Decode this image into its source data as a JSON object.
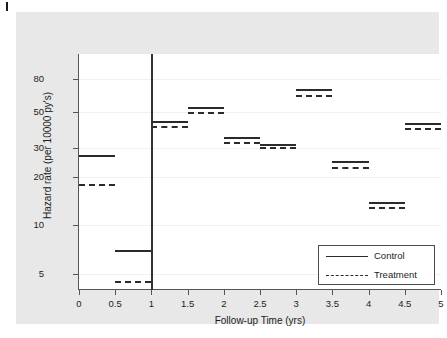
{
  "chart_data": {
    "type": "line",
    "title": "",
    "xlabel": "Follow-up Time (yrs)",
    "ylabel": "Hazard rate (per 10000 py's)",
    "xlim": [
      0,
      5
    ],
    "ylim": [
      4.2,
      90
    ],
    "yscale": "log",
    "grid": true,
    "legend_position": "bottom-right",
    "x_ticks": [
      "0",
      "0.5",
      "1",
      "1.5",
      "2",
      "2.5",
      "3",
      "3.5",
      "4",
      "4.5",
      "5"
    ],
    "x_tick_values": [
      0,
      0.5,
      1,
      1.5,
      2,
      2.5,
      3,
      3.5,
      4,
      4.5,
      5
    ],
    "y_ticks": [
      "5",
      "10",
      "20",
      "30",
      "50",
      "80"
    ],
    "y_tick_values": [
      5,
      10,
      20,
      30,
      50,
      80
    ],
    "annotations": [
      {
        "name": "vertical-reference-line",
        "x": 1
      }
    ],
    "intervals": [
      [
        0,
        0.5
      ],
      [
        0.5,
        1
      ],
      [
        1,
        1.5
      ],
      [
        1.5,
        2
      ],
      [
        2,
        2.5
      ],
      [
        2.5,
        3
      ],
      [
        3,
        3.5
      ],
      [
        3.5,
        4
      ],
      [
        4,
        4.5
      ],
      [
        4.5,
        5
      ]
    ],
    "series": [
      {
        "name": "Control",
        "style": "solid",
        "color": "#2b2b2b",
        "values": [
          27,
          7,
          44,
          54,
          35,
          32,
          70,
          25,
          14,
          43
        ]
      },
      {
        "name": "Treatment",
        "style": "dashed",
        "color": "#2b2b2b",
        "values": [
          18,
          4.5,
          41,
          50.5,
          32.5,
          30.3,
          64,
          23,
          13,
          40
        ]
      }
    ]
  },
  "legend": {
    "items": [
      {
        "label": "Control",
        "style": "solid"
      },
      {
        "label": "Treatment",
        "style": "dashed"
      }
    ]
  }
}
